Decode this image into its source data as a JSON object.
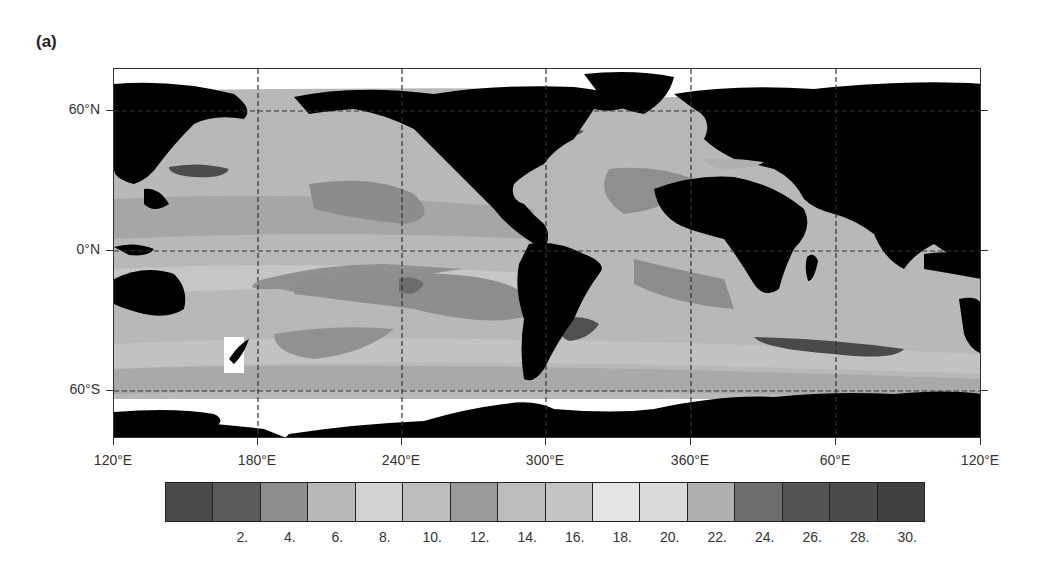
{
  "figure": {
    "panel_label": "(a)"
  },
  "chart_data": {
    "type": "heatmap",
    "title": "(a)",
    "subtype": "global ocean contour map (filled, grayscale) with land masked black",
    "xlabel": "",
    "ylabel": "",
    "x_ticks": [
      "120°E",
      "180°E",
      "240°E",
      "300°E",
      "360°E",
      "60°E",
      "120°E"
    ],
    "y_ticks": [
      "60°N",
      "0°N",
      "60°S"
    ],
    "grid": "dashed at tick positions",
    "colorbar": {
      "orientation": "horizontal",
      "position": "bottom",
      "levels": [
        "2.",
        "4.",
        "6.",
        "8.",
        "10.",
        "12.",
        "14.",
        "16.",
        "18.",
        "20.",
        "22.",
        "24.",
        "26.",
        "28.",
        "30."
      ],
      "n_boxes": 16,
      "box_colors": [
        "#4a4a4a",
        "#5a5a5a",
        "#8e8e8e",
        "#b8b8b8",
        "#d2d2d2",
        "#bdbdbd",
        "#9a9a9a",
        "#bcbcbc",
        "#c4c4c4",
        "#e4e4e4",
        "#dadada",
        "#b0b0b0",
        "#6e6e6e",
        "#545454",
        "#4a4a4a",
        "#404040"
      ]
    },
    "features": [
      {
        "name": "Kuroshio extension",
        "level_range": "dark (26-30)"
      },
      {
        "name": "Gulf Stream",
        "level_range": "dark (26-30)"
      },
      {
        "name": "Agulhas retroflection",
        "level_range": "dark (26-30)"
      },
      {
        "name": "Brazil-Malvinas confluence",
        "level_range": "dark (26-30)"
      },
      {
        "name": "Subtropical gyres",
        "level_range": "medium-dark (24)"
      }
    ]
  },
  "colors": {
    "land": "#000000",
    "ice_nodata": "#ffffff",
    "ocean_base": "#b4b4b4",
    "gridline": "#333333"
  }
}
